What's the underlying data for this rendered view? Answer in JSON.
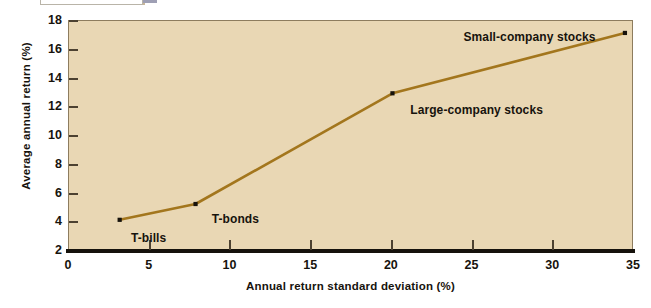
{
  "figure": {
    "background_color": "#ffffff",
    "plot_background_color": "#e9d7b4",
    "series_color": "#a3761d",
    "axis_color": "#16120c"
  },
  "top_crop": {
    "note": ""
  },
  "chart_data": {
    "type": "line",
    "title": "",
    "xlabel": "Annual return standard deviation (%)",
    "ylabel": "Average annual return (%)",
    "xlim": [
      0,
      35
    ],
    "ylim": [
      2,
      18
    ],
    "xticks": [
      0,
      5,
      10,
      15,
      20,
      25,
      30,
      35
    ],
    "xtick_labels": [
      "0",
      "5",
      "10",
      "15",
      "20",
      "25",
      "30",
      "35"
    ],
    "yticks": [
      2,
      4,
      6,
      8,
      10,
      12,
      14,
      16,
      18
    ],
    "ytick_labels": [
      "2",
      "4",
      "6",
      "8",
      "10",
      "12",
      "14",
      "16",
      "18"
    ],
    "grid": false,
    "legend": false,
    "series": [
      {
        "name": "Risk-return tradeoff",
        "color": "#a3761d",
        "marker": "point",
        "points": [
          {
            "label": "T-bills",
            "x": 3.2,
            "y": 4.1
          },
          {
            "label": "T-bonds",
            "x": 7.9,
            "y": 5.2
          },
          {
            "label": "Large-company stocks",
            "x": 20.1,
            "y": 12.9
          },
          {
            "label": "Small-company stocks",
            "x": 34.5,
            "y": 17.1
          }
        ]
      }
    ],
    "annotations": [
      {
        "text": "T-bills",
        "x": 3.9,
        "y": 2.85
      },
      {
        "text": "T-bonds",
        "x": 8.9,
        "y": 4.15
      },
      {
        "text": "Large-company stocks",
        "x": 21.2,
        "y": 11.75
      },
      {
        "text": "Small-company stocks",
        "x": 24.5,
        "y": 16.85
      }
    ]
  }
}
